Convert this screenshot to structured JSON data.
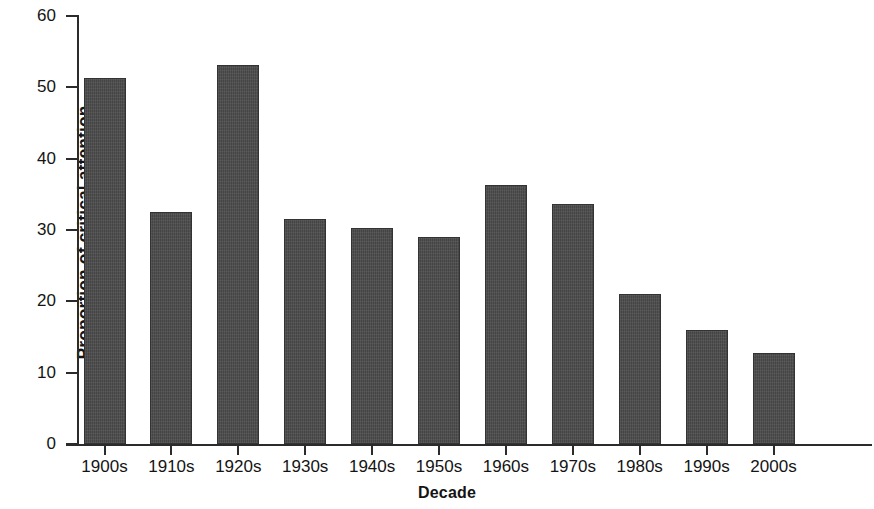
{
  "chart_data": {
    "type": "bar",
    "title": "",
    "subtitle": "",
    "xlabel": "Decade",
    "ylabel": "Proportion of critical attention",
    "categories": [
      "1900s",
      "1910s",
      "1920s",
      "1930s",
      "1940s",
      "1950s",
      "1960s",
      "1970s",
      "1980s",
      "1990s",
      "2000s"
    ],
    "values": [
      51.3,
      32.5,
      53.1,
      31.5,
      30.3,
      29.0,
      36.3,
      33.6,
      21.0,
      16.0,
      12.7
    ],
    "ylim": [
      0,
      60
    ],
    "ytick_labels": [
      "0",
      "10",
      "20",
      "30",
      "40",
      "50",
      "60"
    ],
    "ytick_values": [
      0,
      10,
      20,
      30,
      40,
      50,
      60
    ],
    "grid": false,
    "legend": false,
    "legend_position": "none",
    "bar_color": "#4b4b4b",
    "axis_color": "#2b2b2b",
    "background_color": "#ffffff"
  },
  "axes": {
    "x_title": "Decade",
    "y_title": "Proportion of critical attention"
  }
}
